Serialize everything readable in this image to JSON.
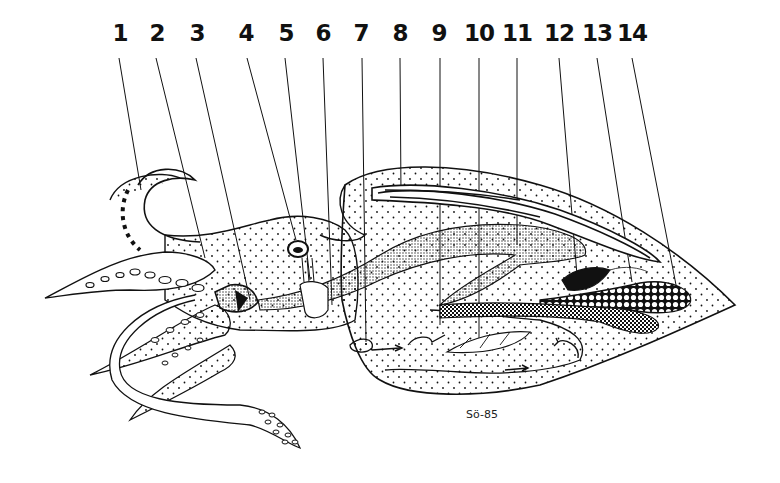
{
  "figure": {
    "signature": "Sö-85",
    "colors": {
      "ink": "#111111",
      "background": "#ffffff"
    }
  },
  "labels": [
    {
      "number": "1",
      "x": 120
    },
    {
      "number": "2",
      "x": 157
    },
    {
      "number": "3",
      "x": 197
    },
    {
      "number": "4",
      "x": 246
    },
    {
      "number": "5",
      "x": 286
    },
    {
      "number": "6",
      "x": 323
    },
    {
      "number": "7",
      "x": 361
    },
    {
      "number": "8",
      "x": 400
    },
    {
      "number": "9",
      "x": 439
    },
    {
      "number": "10",
      "x": 479
    },
    {
      "number": "11",
      "x": 517
    },
    {
      "number": "12",
      "x": 559
    },
    {
      "number": "13",
      "x": 597
    },
    {
      "number": "14",
      "x": 632
    }
  ]
}
